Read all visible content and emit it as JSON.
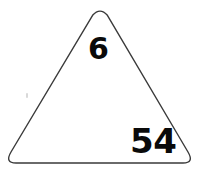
{
  "figure": {
    "background_color": "#ffffff",
    "outline_color": "#3a3a3a",
    "outline_width_px": 1.4,
    "numeral_color": "#0a0a0a"
  },
  "shape": {
    "name": "rounded-triangle",
    "type": "triangle",
    "corner_radius_px": 12,
    "vertices": {
      "apex": {
        "x": 100,
        "y": 9
      },
      "bottom_left": {
        "x": 9,
        "y": 163
      },
      "bottom_right": {
        "x": 190,
        "y": 163
      }
    }
  },
  "labels": {
    "top": {
      "value": "6",
      "position": {
        "x": 88,
        "y": 34
      },
      "font_size_px": 30
    },
    "bottom_right": {
      "value": "54",
      "position": {
        "x": 130,
        "y": 124
      },
      "font_size_px": 34
    }
  },
  "artifacts": {
    "speck": {
      "name": "scan-speck",
      "position": {
        "x": 26,
        "y": 93
      },
      "color": "#d9d9d9"
    }
  }
}
